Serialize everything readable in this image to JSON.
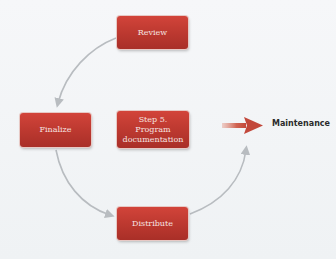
{
  "diagram": {
    "type": "cycle",
    "nodes": [
      {
        "id": "review",
        "label": "Review"
      },
      {
        "id": "finalize",
        "label": "Finalize"
      },
      {
        "id": "program_documentation",
        "label": "Step 5. Program documentation",
        "lines": [
          "Step 5.",
          "Program",
          "documentation"
        ]
      },
      {
        "id": "distribute",
        "label": "Distribute"
      }
    ],
    "edges": [
      {
        "from": "review",
        "to": "finalize"
      },
      {
        "from": "finalize",
        "to": "distribute"
      },
      {
        "from": "distribute",
        "to": "review"
      },
      {
        "from": "program_documentation",
        "to": "maintenance",
        "style": "block-arrow"
      }
    ],
    "output_label": "Maintenance",
    "colors": {
      "box": "#c03b32",
      "box_text": "#f6e4e1",
      "connector": "#b8bcc0",
      "block_arrow": "#c8513f",
      "background": "#f3f5f7",
      "label_text": "#2b2b2b"
    }
  }
}
